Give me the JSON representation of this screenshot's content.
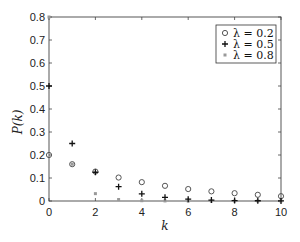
{
  "chart_data": {
    "type": "scatter",
    "title": "",
    "xlabel": "k",
    "ylabel": "P(k)",
    "xlim": [
      0,
      10
    ],
    "ylim": [
      0,
      0.8
    ],
    "xticks": [
      0,
      2,
      4,
      6,
      8,
      10
    ],
    "yticks": [
      0,
      0.1,
      0.2,
      0.3,
      0.4,
      0.5,
      0.6,
      0.7,
      0.8
    ],
    "xtick_labels": [
      "0",
      "2",
      "4",
      "6",
      "8",
      "10"
    ],
    "ytick_labels": [
      "0",
      "0.1",
      "0.2",
      "0.3",
      "0.4",
      "0.5",
      "0.6",
      "0.7",
      "0.8"
    ],
    "grid": false,
    "legend_position": "upper right",
    "x": [
      0,
      1,
      2,
      3,
      4,
      5,
      6,
      7,
      8,
      9,
      10
    ],
    "series": [
      {
        "name": "λ = 0.2",
        "marker": "circle",
        "color": "#555555",
        "values": [
          0.2,
          0.16,
          0.128,
          0.102,
          0.082,
          0.066,
          0.052,
          0.042,
          0.034,
          0.027,
          0.021
        ]
      },
      {
        "name": "λ = 0.5",
        "marker": "plus",
        "color": "#111111",
        "values": [
          0.5,
          0.25,
          0.125,
          0.0625,
          0.031,
          0.016,
          0.008,
          0.004,
          0.002,
          0.001,
          0.0005
        ]
      },
      {
        "name": "λ = 0.8",
        "marker": "square",
        "color": "#999999",
        "values": [
          0.8,
          0.16,
          0.032,
          0.0064,
          0.0013,
          0.0003,
          0.0001,
          0.0,
          0.0,
          0.0,
          0.0
        ]
      }
    ]
  },
  "legend": {
    "items": [
      "λ = 0.2",
      "λ = 0.5",
      "λ = 0.8"
    ]
  },
  "axes": {
    "xlabel": "k",
    "ylabel": "P(k)"
  }
}
